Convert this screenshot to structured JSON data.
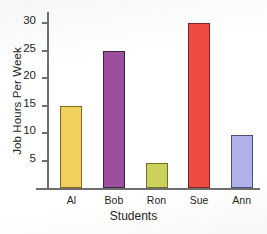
{
  "chart_data": {
    "type": "bar",
    "title": "",
    "xlabel": "Students",
    "ylabel": "Job Hours Per Week",
    "categories": [
      "Al",
      "Bob",
      "Ron",
      "Sue",
      "Ann"
    ],
    "values": [
      15,
      25,
      4.6,
      30,
      9.7
    ],
    "value_labels": [
      "15",
      "25",
      "5",
      "30",
      "10"
    ],
    "ylim": [
      0,
      32
    ],
    "yticks": [
      5,
      10,
      15,
      20,
      25,
      30
    ],
    "ytick_labels": [
      "5",
      "10",
      "15",
      "20",
      "25",
      "30"
    ],
    "grid": false,
    "legend": "none",
    "bar_colors": [
      "#f2d05c",
      "#9b4f9c",
      "#ccd15c",
      "#ef4b45",
      "#b0b1e8"
    ],
    "bar_edge_colors": [
      "#7d6a25",
      "#3f2440",
      "#6d7028",
      "#7e2420",
      "#4d4f7a"
    ]
  },
  "axis": {
    "y_title": "Job Hours Per Week",
    "x_title": "Students"
  }
}
